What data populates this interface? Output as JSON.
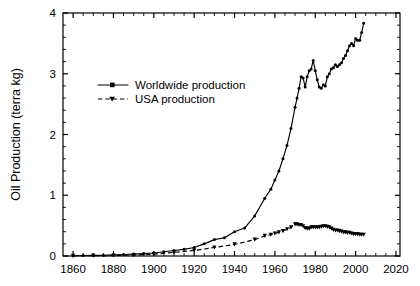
{
  "chart_data": {
    "type": "line",
    "title": "",
    "xlabel": "",
    "ylabel": "Oil Production (terra kg)",
    "xlim": [
      1855,
      2022
    ],
    "ylim": [
      0,
      4
    ],
    "xticks": [
      1860,
      1880,
      1900,
      1920,
      1940,
      1960,
      1980,
      2000,
      2020
    ],
    "xtick_labels": [
      "1860",
      "1880",
      "1900",
      "1920",
      "1940",
      "1960",
      "1980",
      "2000",
      "2020"
    ],
    "yticks": [
      0,
      1,
      2,
      3,
      4
    ],
    "ytick_labels": [
      "0",
      "1",
      "2",
      "3",
      "4"
    ],
    "x_minor_interval": 5,
    "y_minor_interval": 0.2,
    "grid": false,
    "legend_position": "upper-left-inside",
    "series": [
      {
        "name": "Worldwide production",
        "marker": "circle",
        "linestyle": "solid",
        "color": "#000000",
        "x": [
          1860,
          1865,
          1870,
          1875,
          1880,
          1885,
          1890,
          1895,
          1900,
          1905,
          1910,
          1915,
          1920,
          1925,
          1930,
          1935,
          1940,
          1945,
          1950,
          1955,
          1958,
          1960,
          1962,
          1964,
          1966,
          1968,
          1970,
          1971,
          1972,
          1973,
          1974,
          1975,
          1976,
          1977,
          1978,
          1979,
          1980,
          1981,
          1982,
          1983,
          1984,
          1985,
          1986,
          1987,
          1988,
          1989,
          1990,
          1991,
          1992,
          1993,
          1994,
          1995,
          1996,
          1997,
          1998,
          1999,
          2000,
          2001,
          2002,
          2003,
          2004
        ],
        "y": [
          0.005,
          0.008,
          0.01,
          0.013,
          0.018,
          0.024,
          0.032,
          0.04,
          0.05,
          0.07,
          0.09,
          0.11,
          0.14,
          0.2,
          0.27,
          0.3,
          0.4,
          0.46,
          0.66,
          0.95,
          1.1,
          1.25,
          1.4,
          1.6,
          1.82,
          2.1,
          2.45,
          2.6,
          2.76,
          2.95,
          2.93,
          2.78,
          2.95,
          3.05,
          3.08,
          3.22,
          3.05,
          2.9,
          2.78,
          2.76,
          2.82,
          2.8,
          2.95,
          3.0,
          3.08,
          3.1,
          3.15,
          3.12,
          3.15,
          3.18,
          3.25,
          3.3,
          3.38,
          3.46,
          3.5,
          3.46,
          3.58,
          3.55,
          3.55,
          3.68,
          3.83
        ]
      },
      {
        "name": "USA production",
        "marker": "triangle-down",
        "linestyle": "dashed",
        "color": "#000000",
        "x": [
          1860,
          1870,
          1880,
          1890,
          1900,
          1910,
          1920,
          1930,
          1940,
          1950,
          1955,
          1958,
          1960,
          1962,
          1964,
          1966,
          1968,
          1970,
          1971,
          1972,
          1973,
          1974,
          1975,
          1976,
          1977,
          1978,
          1979,
          1980,
          1981,
          1982,
          1983,
          1984,
          1985,
          1986,
          1987,
          1988,
          1989,
          1990,
          1991,
          1992,
          1993,
          1994,
          1995,
          1996,
          1997,
          1998,
          1999,
          2000,
          2001,
          2002,
          2003,
          2004
        ],
        "y": [
          0.003,
          0.005,
          0.008,
          0.016,
          0.03,
          0.06,
          0.09,
          0.14,
          0.19,
          0.27,
          0.33,
          0.35,
          0.37,
          0.39,
          0.41,
          0.44,
          0.47,
          0.52,
          0.52,
          0.51,
          0.51,
          0.49,
          0.46,
          0.45,
          0.45,
          0.47,
          0.47,
          0.47,
          0.47,
          0.47,
          0.48,
          0.49,
          0.49,
          0.48,
          0.47,
          0.45,
          0.43,
          0.42,
          0.42,
          0.41,
          0.4,
          0.39,
          0.39,
          0.38,
          0.38,
          0.37,
          0.36,
          0.36,
          0.36,
          0.35,
          0.35,
          0.35
        ]
      }
    ],
    "legend": [
      {
        "label": "Worldwide production",
        "marker": "circle",
        "linestyle": "solid"
      },
      {
        "label": "USA production",
        "marker": "triangle-down",
        "linestyle": "dashed"
      }
    ]
  }
}
